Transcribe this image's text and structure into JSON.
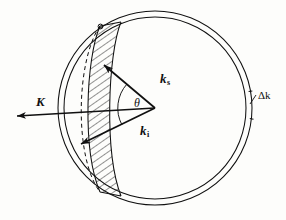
{
  "figure": {
    "kind": "scattering-sphere-diagram",
    "background_color": "#fdfdfb",
    "ink_color": "#101010"
  },
  "labels": {
    "scattered_vector": "k",
    "scattered_vector_sub": "s",
    "incident_vector": "k",
    "incident_vector_sub": "i",
    "scattering_vector": "K",
    "angle": "θ",
    "shell_thickness": "Δk"
  },
  "geometry": {
    "center_x": 155,
    "center_y": 108,
    "outer_radius": 97,
    "inner_radius": 91,
    "vertex_x": 155,
    "vertex_y": 108
  }
}
